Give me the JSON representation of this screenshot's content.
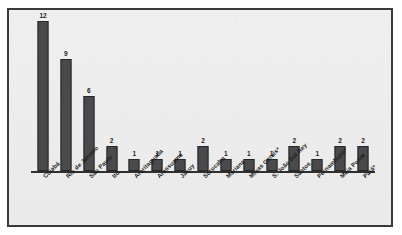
{
  "chart_data": {
    "type": "bar",
    "title": "",
    "xlabel": "",
    "ylabel": "",
    "ylim": [
      0,
      12
    ],
    "grid": false,
    "legend": "none",
    "categories": [
      "Cuiabá",
      "Rio de Janeiro",
      "São Paulo",
      "Itú",
      "Araritaguaba",
      "Arassuama",
      "Jacuy",
      "Sorocaba",
      "Mariana",
      "Minas Gerais*",
      "S. João Del Rey",
      "Santos",
      "Pernambuco*",
      "Meia Ponte",
      "Pará*"
    ],
    "values": [
      12,
      9,
      6,
      2,
      1,
      1,
      1,
      2,
      1,
      1,
      1,
      2,
      1,
      2,
      2
    ],
    "value_labels": [
      "12",
      "9",
      "6",
      "2",
      "1",
      "1",
      "1",
      "2",
      "1",
      "1",
      "1",
      "2",
      "1",
      "2",
      "2"
    ],
    "colors": {
      "bar_fill": "#4a4a4c",
      "bar_stroke": "#262627",
      "axis": "#2f2f31",
      "frame": "#3a3a3c",
      "plot_background": "#ededed",
      "page_background": "#ffffff",
      "label_text": "#1b1b1c"
    }
  }
}
